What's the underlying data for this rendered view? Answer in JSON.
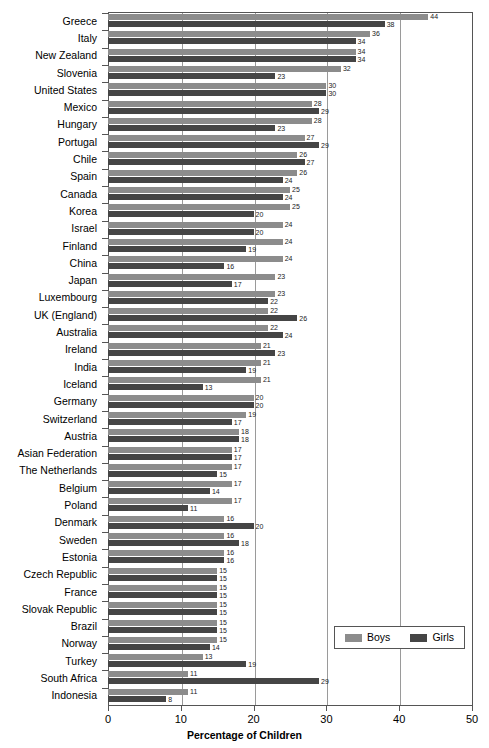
{
  "chart_data": {
    "type": "bar",
    "orientation": "horizontal",
    "title": "",
    "subtitle": "",
    "xlabel": "Percentage of Children",
    "ylabel": "",
    "xlim": [
      0,
      50
    ],
    "xticks": [
      0,
      10,
      20,
      30,
      40,
      50
    ],
    "xtick_labels": [
      "0",
      "10",
      "20",
      "30",
      "40",
      "50"
    ],
    "grid": "vertical",
    "legend_position": "bottom-right",
    "categories": [
      "Greece",
      "Italy",
      "New Zealand",
      "Slovenia",
      "United States",
      "Mexico",
      "Hungary",
      "Portugal",
      "Chile",
      "Spain",
      "Canada",
      "Korea",
      "Israel",
      "Finland",
      "China",
      "Japan",
      "Luxembourg",
      "UK (England)",
      "Australia",
      "Ireland",
      "India",
      "Iceland",
      "Germany",
      "Switzerland",
      "Austria",
      "Asian Federation",
      "The Netherlands",
      "Belgium",
      "Poland",
      "Denmark",
      "Sweden",
      "Estonia",
      "Czech Republic",
      "France",
      "Slovak Republic",
      "Brazil",
      "Norway",
      "Turkey",
      "South Africa",
      "Indonesia"
    ],
    "series": [
      {
        "name": "Boys",
        "color": "#8c8c8c",
        "values": [
          44,
          36,
          34,
          32,
          30,
          28,
          28,
          27,
          26,
          26,
          25,
          25,
          24,
          24,
          24,
          23,
          23,
          22,
          22,
          21,
          21,
          21,
          20,
          19,
          18,
          17,
          17,
          17,
          17,
          16,
          16,
          16,
          15,
          15,
          15,
          15,
          15,
          13,
          11,
          11
        ]
      },
      {
        "name": "Girls",
        "color": "#454545",
        "values": [
          38,
          34,
          34,
          23,
          30,
          29,
          23,
          29,
          27,
          24,
          24,
          20,
          20,
          19,
          16,
          17,
          22,
          26,
          24,
          23,
          19,
          13,
          20,
          17,
          18,
          17,
          15,
          14,
          11,
          20,
          18,
          16,
          15,
          15,
          15,
          15,
          14,
          19,
          29,
          8
        ]
      }
    ]
  },
  "legend": {
    "items": [
      {
        "label": "Boys",
        "color": "#8c8c8c"
      },
      {
        "label": "Girls",
        "color": "#454545"
      }
    ]
  },
  "axis": {
    "x_title": "Percentage of Children"
  }
}
